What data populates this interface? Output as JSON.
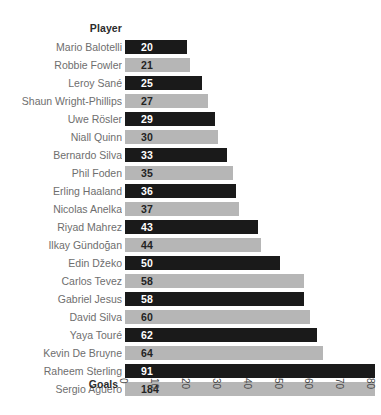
{
  "header": {
    "player_column_label": "Player"
  },
  "axis": {
    "goals_label": "Goals",
    "ticks": [
      "0",
      "10",
      "20",
      "30",
      "40",
      "50",
      "60",
      "70",
      "80"
    ]
  },
  "colors": {
    "bar_dark": "#1a1a1a",
    "bar_light": "#b6b6b6",
    "label_text": "#6e6e6e",
    "header_text": "#2b2b2b",
    "background": "#ffffff"
  },
  "chart_data": {
    "type": "bar",
    "orientation": "horizontal",
    "title": "",
    "subtitle": "",
    "xlabel": "Goals",
    "ylabel": "Player",
    "xlim": [
      0,
      80
    ],
    "xticks": [
      0,
      10,
      20,
      30,
      40,
      50,
      60,
      70,
      80
    ],
    "grid": false,
    "legend": null,
    "note": "Bars for 91 and 184 extend past the plotted 0-80 axis range and are clipped at the right edge.",
    "categories": [
      "Mario Balotelli",
      "Robbie Fowler",
      "Leroy Sané",
      "Shaun Wright-Phillips",
      "Uwe Rösler",
      "Niall Quinn",
      "Bernardo Silva",
      "Phil Foden",
      "Erling Haaland",
      "Nicolas Anelka",
      "Riyad Mahrez",
      "Ilkay Gündoğan",
      "Edin Džeko",
      "Carlos Tevez",
      "Gabriel Jesus",
      "David Silva",
      "Yaya Touré",
      "Kevin De Bruyne",
      "Raheem Sterling",
      "Sergio Agüero"
    ],
    "values": [
      20,
      21,
      25,
      27,
      29,
      30,
      33,
      35,
      36,
      37,
      43,
      44,
      50,
      58,
      58,
      60,
      62,
      64,
      91,
      184
    ],
    "bar_styles": [
      "dark",
      "light",
      "dark",
      "light",
      "dark",
      "light",
      "dark",
      "light",
      "dark",
      "light",
      "dark",
      "light",
      "dark",
      "light",
      "dark",
      "light",
      "dark",
      "light",
      "dark",
      "light"
    ]
  }
}
